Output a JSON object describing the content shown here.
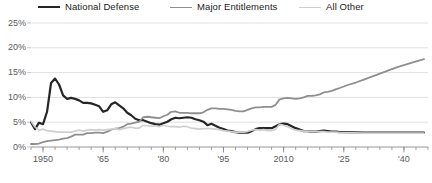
{
  "legend": {
    "position": "top",
    "items": [
      {
        "label": "National Defense",
        "color": "#262626",
        "icon": "line-swatch-icon"
      },
      {
        "label": "Major Entitlements",
        "color": "#8f8f8f",
        "icon": "line-swatch-icon"
      },
      {
        "label": "All Other",
        "color": "#cfcfcf",
        "icon": "line-swatch-icon"
      }
    ]
  },
  "axes": {
    "y_ticks": [
      "0%",
      "5%",
      "10%",
      "15%",
      "20%",
      "25%"
    ],
    "y_labels_top_down": [
      "25%",
      "20%",
      "15%",
      "10%",
      "5%",
      "0%"
    ],
    "x_ticks": [
      "1950",
      "'65",
      "'80",
      "'95",
      "2010",
      "'25",
      "'40"
    ]
  },
  "chart_data": {
    "type": "line",
    "title": "",
    "subtitle": "",
    "xlabel": "",
    "ylabel": "",
    "xlim": [
      1947,
      2046
    ],
    "ylim": [
      0,
      25
    ],
    "grid": true,
    "y_unit": "percent of GDP",
    "legend_position": "top",
    "x_tick_values": [
      1950,
      1965,
      1980,
      1995,
      2010,
      2025,
      2040
    ],
    "x_tick_labels": [
      "1950",
      "'65",
      "'80",
      "'95",
      "2010",
      "'25",
      "'40"
    ],
    "y_tick_values": [
      0,
      5,
      10,
      15,
      20,
      25
    ],
    "y_tick_labels": [
      "0%",
      "5%",
      "10%",
      "15%",
      "20%",
      "25%"
    ],
    "x_minor_tick_interval": 3,
    "series": [
      {
        "name": "National Defense",
        "color": "#262626",
        "width": 2.2,
        "x": [
          1947,
          1948,
          1949,
          1950,
          1951,
          1952,
          1953,
          1954,
          1955,
          1956,
          1957,
          1958,
          1959,
          1960,
          1961,
          1962,
          1963,
          1964,
          1965,
          1966,
          1967,
          1968,
          1969,
          1970,
          1971,
          1972,
          1973,
          1974,
          1975,
          1976,
          1977,
          1978,
          1979,
          1980,
          1981,
          1982,
          1983,
          1984,
          1985,
          1986,
          1987,
          1988,
          1989,
          1990,
          1991,
          1992,
          1993,
          1994,
          1995,
          1996,
          1997,
          1998,
          1999,
          2000,
          2001,
          2002,
          2003,
          2004,
          2005,
          2006,
          2007,
          2008,
          2009,
          2010,
          2011,
          2012,
          2013,
          2014,
          2015,
          2016,
          2017,
          2018,
          2019,
          2020,
          2021,
          2022,
          2023,
          2024,
          2025,
          2030,
          2035,
          2040,
          2045
        ],
        "values": [
          5.0,
          3.6,
          4.9,
          4.6,
          7.1,
          12.9,
          13.8,
          12.6,
          10.4,
          9.7,
          9.9,
          9.7,
          9.4,
          8.9,
          8.9,
          8.8,
          8.5,
          8.2,
          7.1,
          7.4,
          8.6,
          9.0,
          8.4,
          7.8,
          6.9,
          6.4,
          5.7,
          5.4,
          5.4,
          5.1,
          4.8,
          4.6,
          4.5,
          4.8,
          5.1,
          5.6,
          5.9,
          5.8,
          5.9,
          6.0,
          5.9,
          5.6,
          5.4,
          5.1,
          4.4,
          4.7,
          4.3,
          3.9,
          3.6,
          3.3,
          3.2,
          3.0,
          2.9,
          2.9,
          2.9,
          3.2,
          3.6,
          3.8,
          3.8,
          3.8,
          3.8,
          4.2,
          4.6,
          4.7,
          4.6,
          4.2,
          3.8,
          3.5,
          3.2,
          3.2,
          3.1,
          3.1,
          3.2,
          3.3,
          3.2,
          3.1,
          3.1,
          3.0,
          3.0,
          2.9,
          2.9,
          2.9,
          2.9
        ]
      },
      {
        "name": "Major Entitlements",
        "color": "#8f8f8f",
        "width": 1.8,
        "x": [
          1947,
          1948,
          1949,
          1950,
          1951,
          1952,
          1953,
          1954,
          1955,
          1956,
          1957,
          1958,
          1959,
          1960,
          1961,
          1962,
          1963,
          1964,
          1965,
          1966,
          1967,
          1968,
          1969,
          1970,
          1971,
          1972,
          1973,
          1974,
          1975,
          1976,
          1977,
          1978,
          1979,
          1980,
          1981,
          1982,
          1983,
          1984,
          1985,
          1986,
          1987,
          1988,
          1989,
          1990,
          1991,
          1992,
          1993,
          1994,
          1995,
          1996,
          1997,
          1998,
          1999,
          2000,
          2001,
          2002,
          2003,
          2004,
          2005,
          2006,
          2007,
          2008,
          2009,
          2010,
          2011,
          2012,
          2013,
          2014,
          2015,
          2016,
          2017,
          2018,
          2019,
          2020,
          2021,
          2022,
          2023,
          2024,
          2025,
          2026,
          2028,
          2030,
          2032,
          2034,
          2036,
          2038,
          2040,
          2042,
          2045
        ],
        "values": [
          0.6,
          0.6,
          0.7,
          1.0,
          1.2,
          1.3,
          1.4,
          1.5,
          1.7,
          1.8,
          2.1,
          2.5,
          2.5,
          2.5,
          2.8,
          2.8,
          2.9,
          2.9,
          2.8,
          3.1,
          3.5,
          3.7,
          3.8,
          4.1,
          4.6,
          4.7,
          4.9,
          5.1,
          6.0,
          6.1,
          6.0,
          5.9,
          5.8,
          6.2,
          6.5,
          7.1,
          7.2,
          6.9,
          6.9,
          6.9,
          6.8,
          6.8,
          6.8,
          7.0,
          7.5,
          7.8,
          7.8,
          7.7,
          7.7,
          7.6,
          7.5,
          7.3,
          7.2,
          7.2,
          7.5,
          7.8,
          8.0,
          8.0,
          8.1,
          8.1,
          8.1,
          8.5,
          9.6,
          9.8,
          9.9,
          9.8,
          9.7,
          9.8,
          10.0,
          10.3,
          10.3,
          10.4,
          10.6,
          11.0,
          11.1,
          11.3,
          11.6,
          11.9,
          12.2,
          12.5,
          13.0,
          13.6,
          14.2,
          14.8,
          15.4,
          16.0,
          16.5,
          17.0,
          17.7
        ]
      },
      {
        "name": "All Other",
        "color": "#cfcfcf",
        "width": 1.6,
        "x": [
          1947,
          1948,
          1949,
          1950,
          1951,
          1952,
          1953,
          1954,
          1955,
          1956,
          1957,
          1958,
          1959,
          1960,
          1961,
          1962,
          1963,
          1964,
          1965,
          1966,
          1967,
          1968,
          1969,
          1970,
          1971,
          1972,
          1973,
          1974,
          1975,
          1976,
          1977,
          1978,
          1979,
          1980,
          1981,
          1982,
          1983,
          1984,
          1985,
          1986,
          1987,
          1988,
          1989,
          1990,
          1991,
          1992,
          1993,
          1994,
          1995,
          1996,
          1997,
          1998,
          1999,
          2000,
          2001,
          2002,
          2003,
          2004,
          2005,
          2006,
          2007,
          2008,
          2009,
          2010,
          2011,
          2012,
          2013,
          2014,
          2015,
          2016,
          2017,
          2018,
          2019,
          2020,
          2021,
          2022,
          2023,
          2024,
          2025,
          2030,
          2035,
          2040,
          2045
        ],
        "values": [
          5.2,
          4.0,
          3.4,
          3.6,
          3.3,
          3.2,
          3.1,
          3.0,
          3.0,
          3.0,
          3.0,
          3.2,
          3.4,
          3.2,
          3.4,
          3.5,
          3.4,
          3.5,
          3.4,
          3.5,
          3.6,
          3.7,
          3.5,
          3.7,
          3.9,
          4.0,
          3.8,
          3.8,
          4.4,
          4.3,
          4.2,
          4.3,
          4.1,
          4.4,
          4.2,
          4.1,
          4.1,
          4.0,
          4.2,
          4.1,
          3.8,
          3.7,
          3.6,
          3.7,
          3.7,
          3.7,
          3.6,
          3.5,
          3.3,
          3.2,
          3.1,
          3.0,
          3.0,
          3.0,
          3.1,
          3.4,
          3.5,
          3.4,
          3.5,
          3.3,
          3.3,
          3.6,
          4.6,
          4.4,
          4.1,
          3.7,
          3.4,
          3.3,
          3.2,
          3.2,
          3.1,
          3.1,
          3.1,
          3.1,
          3.0,
          3.0,
          3.0,
          2.9,
          2.9,
          2.8,
          2.8,
          2.8,
          2.8
        ]
      }
    ]
  },
  "geometry": {
    "plot_left": 31,
    "plot_right": 428,
    "plot_top": 7,
    "plot_bottom": 131
  }
}
